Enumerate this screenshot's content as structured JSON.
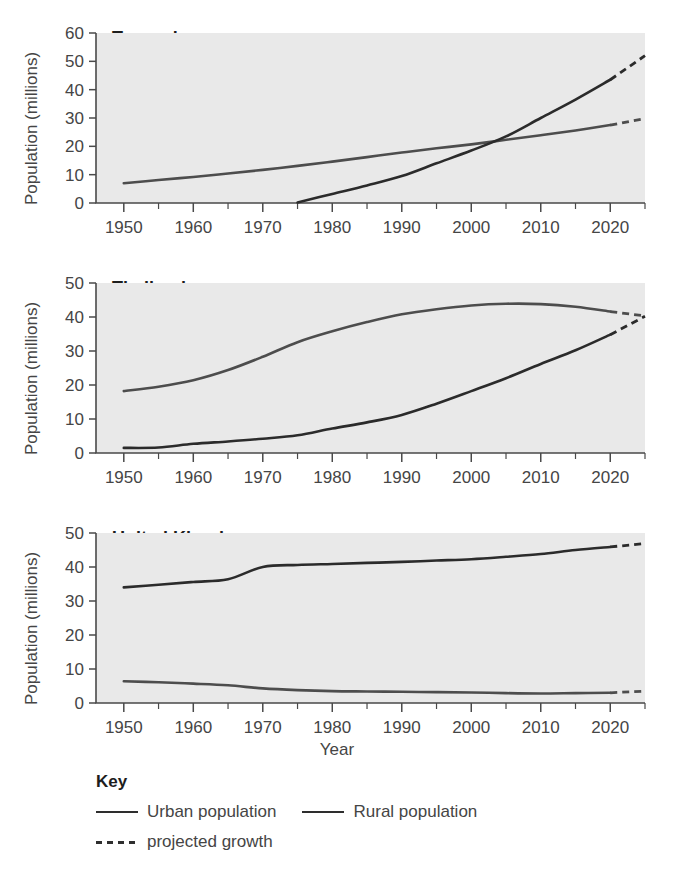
{
  "axis": {
    "xlabel": "Year",
    "ylabel": "Population (millions)",
    "xticks": [
      "1950",
      "1960",
      "1970",
      "1980",
      "1990",
      "2000",
      "2010",
      "2020"
    ],
    "yticks_60": [
      "0",
      "10",
      "20",
      "30",
      "40",
      "50",
      "60"
    ],
    "yticks_50": [
      "0",
      "10",
      "20",
      "30",
      "40",
      "50"
    ]
  },
  "key": {
    "title": "Key",
    "items": [
      {
        "label": "Urban population",
        "style": "solid",
        "color": "#2e2e2e"
      },
      {
        "label": "Rural population",
        "style": "solid",
        "color": "#2e2e2e"
      },
      {
        "label": "projected growth",
        "style": "dashed",
        "color": "#2e2e2e"
      }
    ]
  },
  "colors": {
    "urban": "#2b2b2b",
    "rural": "#4d4d4d",
    "axis": "#4a4a4a",
    "plot_background": "#e9e9e9",
    "page_background": "#ffffff",
    "text": "#454545",
    "title_text": "#1d1d1d"
  },
  "chart_data": [
    {
      "type": "line",
      "title": "Tanzania",
      "xlabel": "Year",
      "ylabel": "Population (millions)",
      "xlim": [
        1946,
        2025
      ],
      "ylim": [
        0,
        60
      ],
      "ytick_step": 10,
      "xtick_step": 10,
      "xminor_step": 5,
      "grid": false,
      "legend": "below-figure",
      "series": [
        {
          "name": "Rural population",
          "style": "solid",
          "x": [
            1950,
            1955,
            1960,
            1965,
            1970,
            1975,
            1980,
            1985,
            1990,
            1995,
            2000,
            2005,
            2010,
            2015,
            2020
          ],
          "values": [
            7.0,
            8.1,
            9.2,
            10.4,
            11.7,
            13.1,
            14.6,
            16.2,
            17.8,
            19.3,
            20.7,
            22.3,
            23.9,
            25.6,
            27.5
          ]
        },
        {
          "name": "Rural population (projected growth)",
          "style": "dashed",
          "x": [
            2020,
            2025
          ],
          "values": [
            27.5,
            29.8
          ]
        },
        {
          "name": "Urban population",
          "style": "solid",
          "x": [
            1975,
            1980,
            1985,
            1990,
            1995,
            2000,
            2005,
            2010,
            2015,
            2020
          ],
          "values": [
            0.2,
            3.2,
            6.2,
            9.5,
            14.0,
            18.5,
            23.5,
            30.0,
            36.5,
            43.5
          ]
        },
        {
          "name": "Urban population (projected growth)",
          "style": "dashed",
          "x": [
            2020,
            2025
          ],
          "values": [
            43.5,
            52.0
          ]
        }
      ],
      "annotations": [
        "Urban and rural curves cross at about 2003 at roughly 22 million"
      ]
    },
    {
      "type": "line",
      "title": "Thailand",
      "xlabel": "Year",
      "ylabel": "Population (millions)",
      "xlim": [
        1946,
        2025
      ],
      "ylim": [
        0,
        50
      ],
      "ytick_step": 10,
      "xtick_step": 10,
      "xminor_step": 5,
      "grid": false,
      "legend": "below-figure",
      "series": [
        {
          "name": "Rural population",
          "style": "solid",
          "x": [
            1950,
            1955,
            1960,
            1965,
            1970,
            1975,
            1980,
            1985,
            1990,
            1995,
            2000,
            2005,
            2010,
            2015,
            2020
          ],
          "values": [
            18.2,
            19.5,
            21.4,
            24.4,
            28.3,
            32.6,
            35.8,
            38.5,
            40.8,
            42.3,
            43.4,
            43.9,
            43.8,
            43.0,
            41.6
          ]
        },
        {
          "name": "Rural population (projected growth)",
          "style": "dashed",
          "x": [
            2020,
            2025
          ],
          "values": [
            41.6,
            40.3
          ]
        },
        {
          "name": "Urban population",
          "style": "solid",
          "x": [
            1950,
            1955,
            1960,
            1965,
            1970,
            1975,
            1980,
            1985,
            1990,
            1995,
            2000,
            2005,
            2010,
            2015,
            2020
          ],
          "values": [
            1.5,
            1.6,
            2.7,
            3.4,
            4.2,
            5.2,
            7.2,
            9.0,
            11.2,
            14.5,
            18.2,
            22.0,
            26.2,
            30.2,
            34.8
          ]
        },
        {
          "name": "Urban population (projected growth)",
          "style": "dashed",
          "x": [
            2020,
            2025
          ],
          "values": [
            34.8,
            40.2
          ]
        }
      ],
      "annotations": [
        "Rural population peaks around 2005 at roughly 44 million"
      ]
    },
    {
      "type": "line",
      "title": "United Kingdom",
      "xlabel": "Year",
      "ylabel": "Population (millions)",
      "xlim": [
        1946,
        2025
      ],
      "ylim": [
        0,
        50
      ],
      "ytick_step": 10,
      "xtick_step": 10,
      "xminor_step": 5,
      "grid": false,
      "legend": "below-figure",
      "series": [
        {
          "name": "Urban population",
          "style": "solid",
          "x": [
            1950,
            1955,
            1960,
            1965,
            1970,
            1975,
            1980,
            1985,
            1990,
            1995,
            2000,
            2005,
            2010,
            2015,
            2020
          ],
          "values": [
            34.0,
            34.8,
            35.6,
            36.4,
            40.0,
            40.6,
            40.9,
            41.2,
            41.5,
            41.9,
            42.3,
            43.0,
            43.8,
            45.0,
            45.9
          ]
        },
        {
          "name": "Urban population (projected growth)",
          "style": "dashed",
          "x": [
            2020,
            2025
          ],
          "values": [
            45.9,
            46.9
          ]
        },
        {
          "name": "Rural population",
          "style": "solid",
          "x": [
            1950,
            1955,
            1960,
            1965,
            1970,
            1975,
            1980,
            1985,
            1990,
            1995,
            2000,
            2005,
            2010,
            2015,
            2020
          ],
          "values": [
            6.4,
            6.1,
            5.7,
            5.2,
            4.3,
            3.8,
            3.5,
            3.4,
            3.3,
            3.2,
            3.1,
            2.9,
            2.8,
            2.9,
            3.0
          ]
        },
        {
          "name": "Rural population (projected growth)",
          "style": "dashed",
          "x": [
            2020,
            2025
          ],
          "values": [
            3.0,
            3.5
          ]
        }
      ],
      "annotations": [
        "Urban line steps up sharply between 1965 and 1972"
      ]
    }
  ]
}
